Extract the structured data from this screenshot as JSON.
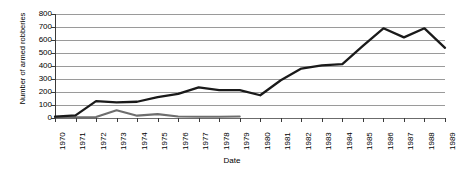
{
  "chart_data": {
    "type": "line",
    "title": "",
    "xlabel": "Date",
    "ylabel": "Number of armed robberies",
    "categories": [
      "1970",
      "1971",
      "1972",
      "1973",
      "1974",
      "1975",
      "1976",
      "1977",
      "1978",
      "1979",
      "1980",
      "1981",
      "1982",
      "1983",
      "1984",
      "1985",
      "1986",
      "1987",
      "1988",
      "1989"
    ],
    "yticks": [
      0,
      100,
      200,
      300,
      400,
      500,
      600,
      700,
      800
    ],
    "ylim": [
      0,
      800
    ],
    "grid": true,
    "legend": "none",
    "series": [
      {
        "name": "armed-robberies-dark",
        "color": "#1a1a1a",
        "values": [
          10,
          20,
          130,
          120,
          125,
          160,
          185,
          235,
          215,
          215,
          175,
          290,
          380,
          405,
          415,
          555,
          690,
          620,
          690,
          540
        ]
      },
      {
        "name": "armed-robberies-grey",
        "color": "#6e6e6e",
        "values": [
          5,
          5,
          8,
          60,
          18,
          30,
          12,
          10,
          10,
          12,
          null,
          null,
          null,
          null,
          null,
          null,
          null,
          null,
          null,
          null
        ]
      }
    ]
  },
  "axes": {
    "y_title": "Number of armed robberies",
    "x_title": "Date",
    "y_tick_labels": [
      "800",
      "700",
      "600",
      "500",
      "400",
      "300",
      "200",
      "100",
      "0"
    ],
    "x_tick_labels": [
      "1970",
      "1971",
      "1972",
      "1973",
      "1974",
      "1975",
      "1976",
      "1977",
      "1978",
      "1979",
      "1980",
      "1981",
      "1982",
      "1983",
      "1984",
      "1985",
      "1986",
      "1987",
      "1988",
      "1989"
    ]
  },
  "colors": {
    "series_primary": "#1a1a1a",
    "series_secondary": "#6e6e6e",
    "gridline": "#9a9a9a",
    "axis": "#3a3a3a",
    "background": "#ffffff"
  }
}
